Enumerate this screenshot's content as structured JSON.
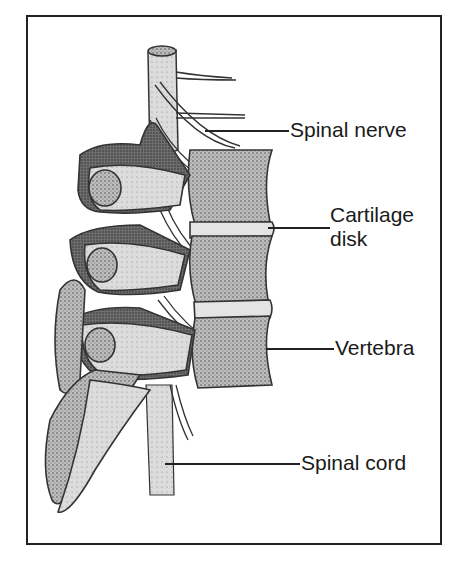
{
  "diagram": {
    "labels": [
      {
        "id": "spinal-nerve",
        "text": "Spinal nerve"
      },
      {
        "id": "cartilage-disk",
        "text": "Cartilage disk",
        "lines": [
          "Cartilage",
          "disk"
        ]
      },
      {
        "id": "vertebra",
        "text": "Vertebra"
      },
      {
        "id": "spinal-cord",
        "text": "Spinal cord"
      }
    ]
  }
}
